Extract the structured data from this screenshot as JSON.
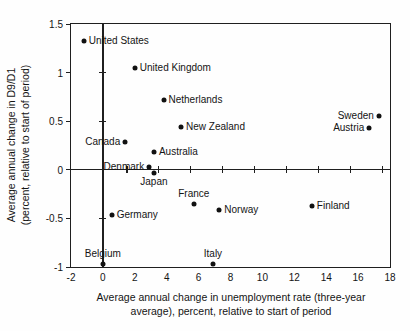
{
  "chart_data": {
    "type": "scatter",
    "title": "",
    "xlabel_line1": "Average annual change in unemployment rate (three-year",
    "xlabel_line2": "average), percent, relative to start of period",
    "ylabel_line1": "Average annual change in D9/D1",
    "ylabel_line2": "(percent, relative to start of period)",
    "xlim": [
      -2,
      18
    ],
    "ylim": [
      -1,
      1.5
    ],
    "x_tick_labels": [
      "-2",
      "0",
      "2",
      "4",
      "6",
      "8",
      "10",
      "12",
      "14",
      "16",
      "18"
    ],
    "x_tick_values": [
      -2,
      0,
      2,
      4,
      6,
      8,
      10,
      12,
      14,
      16,
      18
    ],
    "y_tick_labels": [
      "1.5",
      "1",
      "0.5",
      "0",
      "-0.5",
      "-1"
    ],
    "y_tick_values": [
      1.5,
      1,
      0.5,
      0,
      -0.5,
      -1
    ],
    "zero_h_line_tick_xs": [
      1.5,
      3.5,
      5.5,
      7.5,
      9.5,
      11.5,
      13.5,
      15.5,
      17.5
    ],
    "zero_v_line_tick_ys": [
      1,
      0.5,
      -0.5
    ],
    "grid": "off",
    "legend": "none",
    "marker": "filled-circle",
    "point_color": "#111111",
    "axis_color": "#1f1f1f",
    "points": [
      {
        "label": "United States",
        "x": -1.2,
        "y": 1.32,
        "label_side": "right"
      },
      {
        "label": "United Kingdom",
        "x": 2.0,
        "y": 1.05,
        "label_side": "right"
      },
      {
        "label": "Netherlands",
        "x": 3.8,
        "y": 0.72,
        "label_side": "right"
      },
      {
        "label": "New Zealand",
        "x": 4.9,
        "y": 0.44,
        "label_side": "right"
      },
      {
        "label": "Canada",
        "x": 1.4,
        "y": 0.29,
        "label_side": "left"
      },
      {
        "label": "Australia",
        "x": 3.2,
        "y": 0.18,
        "label_side": "right"
      },
      {
        "label": "Denmark",
        "x": 2.9,
        "y": 0.03,
        "label_side": "left"
      },
      {
        "label": "Japan",
        "x": 3.2,
        "y": -0.03,
        "label_side": "below"
      },
      {
        "label": "France",
        "x": 5.7,
        "y": -0.35,
        "label_side": "above"
      },
      {
        "label": "Norway",
        "x": 7.3,
        "y": -0.41,
        "label_side": "right"
      },
      {
        "label": "Germany",
        "x": 0.55,
        "y": -0.46,
        "label_side": "right"
      },
      {
        "label": "Finland",
        "x": 13.1,
        "y": -0.37,
        "label_side": "right"
      },
      {
        "label": "Sweden",
        "x": 17.3,
        "y": 0.55,
        "label_side": "left"
      },
      {
        "label": "Austria",
        "x": 16.7,
        "y": 0.43,
        "label_side": "left"
      },
      {
        "label": "Belgium",
        "x": 0.0,
        "y": -0.97,
        "label_side": "above"
      },
      {
        "label": "Italy",
        "x": 6.9,
        "y": -0.97,
        "label_side": "above"
      }
    ]
  }
}
